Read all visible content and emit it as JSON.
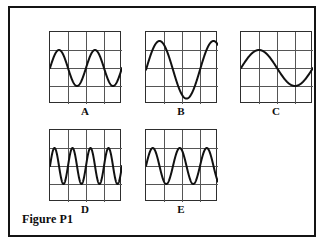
{
  "figure": {
    "caption": "Figure P1",
    "border_color": "#141414",
    "background": "#ffffff"
  },
  "grid": {
    "divisions_x": 4,
    "divisions_y": 4,
    "line_color": "#555555",
    "border_color": "#2e2e2e",
    "trace_color": "#111111",
    "trace_width": 2.0,
    "width_px": 72,
    "height_px": 72
  },
  "chart_data": {
    "type": "line",
    "title": "Figure P1",
    "xlabel": "",
    "ylabel": "",
    "panels": [
      {
        "label": "A",
        "type": "line",
        "waveform": "sine",
        "cycles_visible": 2.0,
        "amplitude_divisions": 1.0,
        "period_divisions": 2.0,
        "vertical_center_division": 2.0,
        "phase_degrees": 0,
        "x": [
          0,
          4
        ],
        "xlim": [
          0,
          4
        ],
        "ylim": [
          0,
          4
        ],
        "grid": true
      },
      {
        "label": "B",
        "type": "line",
        "waveform": "sine",
        "cycles_visible": 1.33,
        "amplitude_divisions": 1.6,
        "period_divisions": 3.0,
        "vertical_center_division": 2.1,
        "phase_degrees": 0,
        "x": [
          0,
          4
        ],
        "xlim": [
          0,
          4
        ],
        "ylim": [
          0,
          4
        ],
        "grid": true
      },
      {
        "label": "C",
        "type": "line",
        "waveform": "sine",
        "cycles_visible": 1.0,
        "amplitude_divisions": 1.0,
        "period_divisions": 4.0,
        "vertical_center_division": 2.0,
        "phase_degrees": 0,
        "x": [
          0,
          4
        ],
        "xlim": [
          0,
          4
        ],
        "ylim": [
          0,
          4
        ],
        "grid": true
      },
      {
        "label": "D",
        "type": "line",
        "waveform": "sine",
        "cycles_visible": 4.0,
        "amplitude_divisions": 1.0,
        "period_divisions": 1.0,
        "vertical_center_division": 2.0,
        "phase_degrees": 0,
        "x": [
          0,
          4
        ],
        "xlim": [
          0,
          4
        ],
        "ylim": [
          0,
          4
        ],
        "grid": true
      },
      {
        "label": "E",
        "type": "line",
        "waveform": "sine",
        "cycles_visible": 2.7,
        "amplitude_divisions": 1.0,
        "period_divisions": 1.5,
        "vertical_center_division": 2.0,
        "phase_degrees": 0,
        "x": [
          0,
          4
        ],
        "xlim": [
          0,
          4
        ],
        "ylim": [
          0,
          4
        ],
        "grid": true
      }
    ]
  },
  "layout": {
    "positions": [
      {
        "label": "A",
        "left": 39,
        "top": 23
      },
      {
        "label": "B",
        "left": 135,
        "top": 23
      },
      {
        "label": "C",
        "left": 230,
        "top": 23
      },
      {
        "label": "D",
        "left": 39,
        "top": 121
      },
      {
        "label": "E",
        "left": 135,
        "top": 121
      }
    ]
  }
}
